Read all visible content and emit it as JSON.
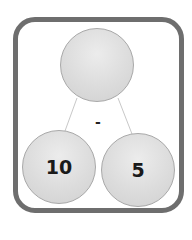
{
  "diagram": {
    "type": "number-bond",
    "operation": "-",
    "top": {
      "value": ""
    },
    "bottom_left": {
      "value": "10"
    },
    "bottom_right": {
      "value": "5"
    }
  },
  "colors": {
    "frame": "#6e6e6e",
    "circle_fill": "#dcdcdc",
    "circle_border": "#a8a8a8",
    "connector": "#c8c8c8",
    "text": "#1a1a1a"
  }
}
